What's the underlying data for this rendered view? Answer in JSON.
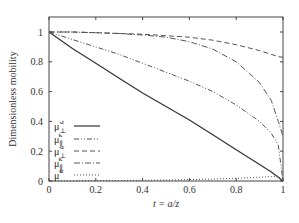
{
  "chart_data": {
    "type": "line",
    "title": "",
    "xlabel": "t = a/z",
    "ylabel": "Dimensionless mobility",
    "xlim": [
      0,
      1
    ],
    "ylim": [
      0,
      1.1
    ],
    "grid": false,
    "legend_position": "lower-left inside",
    "xticks": [
      "0",
      "0.2",
      "0.4",
      "0.6",
      "0.8",
      "1"
    ],
    "yticks": [
      "0",
      "0.2",
      "0.4",
      "0.6",
      "0.8",
      "1"
    ],
    "x": [
      0,
      0.1,
      0.2,
      0.3,
      0.4,
      0.5,
      0.6,
      0.7,
      0.8,
      0.9,
      0.95,
      0.98,
      1.0
    ],
    "series": [
      {
        "name": "μ̃⊥t",
        "label_base": "μ̃",
        "sub": "⊥",
        "sup": "t",
        "style": "solid",
        "values": [
          1.0,
          0.89,
          0.79,
          0.69,
          0.59,
          0.5,
          0.41,
          0.31,
          0.21,
          0.11,
          0.06,
          0.025,
          0.0
        ]
      },
      {
        "name": "μ̃∥t",
        "label_base": "μ̃",
        "sub": "∥",
        "sup": "t",
        "style": "dashdotdot",
        "values": [
          1.0,
          0.95,
          0.9,
          0.85,
          0.79,
          0.73,
          0.67,
          0.6,
          0.51,
          0.4,
          0.32,
          0.24,
          0.0
        ]
      },
      {
        "name": "μ̃⊥r",
        "label_base": "μ̃",
        "sub": "⊥",
        "sup": "r",
        "style": "dashed",
        "values": [
          1.0,
          1.0,
          0.995,
          0.99,
          0.985,
          0.975,
          0.965,
          0.945,
          0.915,
          0.875,
          0.85,
          0.835,
          0.83
        ]
      },
      {
        "name": "μ̃∥r",
        "label_base": "μ̃",
        "sub": "∥",
        "sup": "r",
        "style": "dashdot",
        "values": [
          1.0,
          1.0,
          0.995,
          0.99,
          0.98,
          0.965,
          0.935,
          0.885,
          0.8,
          0.66,
          0.54,
          0.4,
          0.3
        ]
      },
      {
        "name": "μ̃tr",
        "label_base": "μ̃",
        "sub": "",
        "sup": "tr",
        "style": "dotted",
        "values": [
          0.0,
          0.0,
          0.002,
          0.003,
          0.005,
          0.007,
          0.01,
          0.013,
          0.018,
          0.025,
          0.03,
          0.032,
          0.0
        ]
      }
    ]
  }
}
